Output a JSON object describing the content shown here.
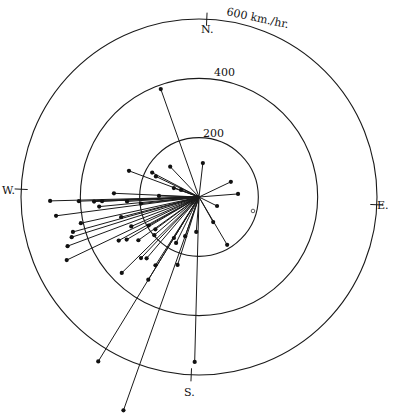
{
  "chart_data": {
    "type": "scatter",
    "subtype": "polar-vector",
    "title": "",
    "unit_label": "600 km./hr.",
    "radial_axis": {
      "range": [
        0,
        600
      ],
      "rings": [
        200,
        400,
        600
      ],
      "ring_labels": [
        "200",
        "400",
        "600 km./hr."
      ],
      "unit": "km/hr"
    },
    "angular_axis": {
      "convention": "compass bearing, degrees clockwise from N",
      "cardinals": [
        {
          "label": "N.",
          "bearing": 0
        },
        {
          "label": "E.",
          "bearing": 90
        },
        {
          "label": "S.",
          "bearing": 180
        },
        {
          "label": "W.",
          "bearing": 270
        }
      ]
    },
    "series": [
      {
        "name": "vectors",
        "marker": "filled-dot",
        "points": [
          {
            "bearing": 338,
            "speed": 386
          },
          {
            "bearing": 4,
            "speed": 115
          },
          {
            "bearing": 62,
            "speed": 119
          },
          {
            "bearing": 83,
            "speed": 132
          },
          {
            "bearing": 114,
            "speed": 68
          },
          {
            "bearing": 148,
            "speed": 97
          },
          {
            "bearing": 147,
            "speed": 187
          },
          {
            "bearing": 314,
            "speed": 141
          },
          {
            "bearing": 295,
            "speed": 178
          },
          {
            "bearing": 293,
            "speed": 161
          },
          {
            "bearing": 288,
            "speed": 252
          },
          {
            "bearing": 287,
            "speed": 90
          },
          {
            "bearing": 289,
            "speed": 65
          },
          {
            "bearing": 269,
            "speed": 135
          },
          {
            "bearing": 270,
            "speed": 287
          },
          {
            "bearing": 266,
            "speed": 502
          },
          {
            "bearing": 265.5,
            "speed": 405
          },
          {
            "bearing": 265,
            "speed": 354
          },
          {
            "bearing": 265,
            "speed": 327
          },
          {
            "bearing": 262,
            "speed": 338
          },
          {
            "bearing": 264,
            "speed": 243
          },
          {
            "bearing": 261,
            "speed": 197
          },
          {
            "bearing": 253,
            "speed": 271
          },
          {
            "bearing": 260,
            "speed": 486
          },
          {
            "bearing": 255,
            "speed": 408
          },
          {
            "bearing": 252,
            "speed": 441
          },
          {
            "bearing": 250,
            "speed": 450
          },
          {
            "bearing": 247,
            "speed": 473
          },
          {
            "bearing": 242,
            "speed": 494
          },
          {
            "bearing": 244,
            "speed": 249
          },
          {
            "bearing": 238,
            "speed": 195
          },
          {
            "bearing": 239,
            "speed": 308
          },
          {
            "bearing": 237,
            "speed": 283
          },
          {
            "bearing": 232,
            "speed": 251
          },
          {
            "bearing": 231,
            "speed": 183
          },
          {
            "bearing": 227,
            "speed": 198
          },
          {
            "bearing": 209,
            "speed": 162
          },
          {
            "bearing": 204,
            "speed": 173
          },
          {
            "bearing": 221,
            "speed": 284
          },
          {
            "bearing": 218,
            "speed": 272
          },
          {
            "bearing": 223,
            "speed": 365
          },
          {
            "bearing": 210,
            "speed": 273
          },
          {
            "bearing": 195,
            "speed": 240
          },
          {
            "bearing": 209,
            "speed": 327
          },
          {
            "bearing": 209,
            "speed": 650
          },
          {
            "bearing": 197,
            "speed": 763
          },
          {
            "bearing": 179,
            "speed": 556
          },
          {
            "bearing": 182,
            "speed": 118
          },
          {
            "bearing": 197,
            "speed": 140
          }
        ]
      },
      {
        "name": "isolated-marker",
        "marker": "open-circle",
        "points": [
          {
            "bearing": 102,
            "speed": 188
          }
        ]
      }
    ],
    "grid": true,
    "legend": "none"
  }
}
